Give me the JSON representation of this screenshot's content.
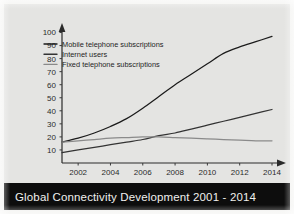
{
  "figure": {
    "caption": "Global Connectivity Development 2001 - 2014",
    "background_color": "#e4e4e2",
    "caption_bar_color": "#0d0d0d",
    "caption_text_color": "#f0f0ee",
    "line_color": "#1f1f1f"
  },
  "axes": {
    "y_ticks": [
      "10",
      "20",
      "30",
      "40",
      "50",
      "60",
      "70",
      "80",
      "90",
      "100"
    ],
    "x_ticks": [
      "2002",
      "2004",
      "2006",
      "2008",
      "2010",
      "2012",
      "2014"
    ],
    "y_axis_arrow": "arrow-up-icon",
    "x_axis_arrow": "arrow-right-icon"
  },
  "legend": {
    "items": [
      {
        "label": "Mobile telephone subscriptions",
        "color": "#1b1b1b",
        "swatch": "line-swatch"
      },
      {
        "label": "Internet users",
        "color": "#333333",
        "swatch": "line-swatch"
      },
      {
        "label": "Fixed telephone subscriptions",
        "color": "#8a8a8a",
        "swatch": "line-swatch"
      }
    ]
  },
  "chart_data": {
    "type": "line",
    "title": "Global Connectivity Development 2001 - 2014",
    "xlabel": "",
    "ylabel": "",
    "xlim": [
      2001,
      2014
    ],
    "ylim": [
      0,
      105
    ],
    "grid": false,
    "legend_position": "top-left",
    "x": [
      2001,
      2002,
      2003,
      2004,
      2005,
      2006,
      2007,
      2008,
      2009,
      2010,
      2011,
      2012,
      2013,
      2014
    ],
    "x_tick_labels": [
      "2002",
      "2004",
      "2006",
      "2008",
      "2010",
      "2012",
      "2014"
    ],
    "y_tick_labels": [
      "10",
      "20",
      "30",
      "40",
      "50",
      "60",
      "70",
      "80",
      "90",
      "100"
    ],
    "series": [
      {
        "name": "Mobile telephone subscriptions",
        "color": "#1b1b1b",
        "values": [
          16,
          19,
          23,
          28,
          34,
          42,
          51,
          60,
          68,
          76,
          84,
          89,
          93,
          97
        ]
      },
      {
        "name": "Internet users",
        "color": "#333333",
        "values": [
          8,
          10,
          12,
          14,
          16,
          18,
          21,
          23,
          26,
          29,
          32,
          35,
          38,
          41
        ]
      },
      {
        "name": "Fixed telephone subscriptions",
        "color": "#8a8a8a",
        "values": [
          16,
          17,
          18,
          19,
          19.5,
          20,
          20,
          19.5,
          19,
          18.5,
          18,
          17.5,
          17,
          17
        ]
      }
    ]
  }
}
